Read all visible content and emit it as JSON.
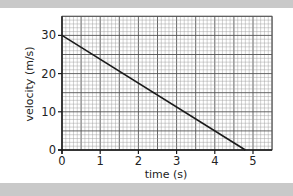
{
  "chart_data": {
    "type": "line",
    "title": "",
    "xlabel": "time (s)",
    "ylabel": "velocity (m/s)",
    "xlim": [
      0,
      5.5
    ],
    "ylim": [
      0,
      35
    ],
    "x_ticks": [
      "0",
      "1",
      "2",
      "3",
      "4",
      "5"
    ],
    "y_ticks": [
      "0",
      "10",
      "20",
      "30"
    ],
    "grid": true,
    "grid_style": "graph paper (minor every 0.1 s / 1 m/s, major every 0.5 s / 5 m/s)",
    "legend": null,
    "series": [
      {
        "name": "velocity",
        "x": [
          0,
          4.8
        ],
        "y": [
          30,
          0
        ],
        "color": "#1a1a1a"
      }
    ]
  },
  "colors": {
    "band": "#c9c9c9",
    "grid_minor": "#9a9a9a",
    "grid_major": "#555555",
    "axis": "#1a1a1a",
    "line": "#1a1a1a"
  }
}
